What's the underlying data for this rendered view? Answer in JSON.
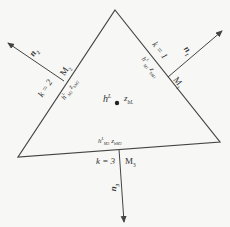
{
  "diagram": {
    "center": {
      "h_label": "h",
      "h_sup": "L",
      "z_label": "z",
      "z_sub": "bL"
    },
    "edges": [
      {
        "k_label": "k = 1",
        "m_label": "M",
        "m_sub": "1",
        "n_label": "n",
        "n_sub": "1",
        "h_label": "h",
        "h_sup": "L",
        "h_sub": "M1",
        "z_label": "z",
        "z_sub": "bM1"
      },
      {
        "k_label": "k = 2",
        "m_label": "M",
        "m_sub": "2",
        "n_label": "n",
        "n_sub": "2",
        "h_label": "h",
        "h_sup": "L",
        "h_sub": "M2",
        "z_label": "z",
        "z_sub": "bM2"
      },
      {
        "k_label": "k = 3",
        "m_label": "M",
        "m_sub": "3",
        "n_label": "n",
        "n_sub": "3",
        "h_label": "h",
        "h_sup": "L",
        "h_sub": "M3",
        "z_label": "z",
        "z_sub": "bM3"
      }
    ],
    "colors": {
      "line": "#444444",
      "text": "#333333",
      "background": "#f7f7f5"
    }
  }
}
